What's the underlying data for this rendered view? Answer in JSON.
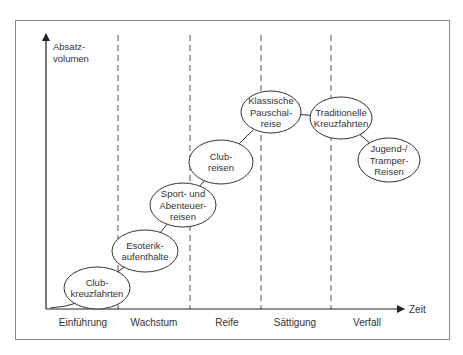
{
  "diagram": {
    "title": "",
    "y_axis_label": [
      "Absatz-",
      "volumen"
    ],
    "x_axis_label": "Zeit",
    "phases": [
      {
        "label": "Einführung"
      },
      {
        "label": "Wachstum"
      },
      {
        "label": "Reife"
      },
      {
        "label": "Sättigung"
      },
      {
        "label": "Verfall"
      }
    ],
    "nodes": [
      {
        "id": "clubkreuzfahrten",
        "lines": [
          "Club-",
          "kreuzfahrten"
        ],
        "phase": "Einführung"
      },
      {
        "id": "esoterik",
        "lines": [
          "Esoterik-",
          "aufenthalte"
        ],
        "phase": "Wachstum"
      },
      {
        "id": "sport",
        "lines": [
          "Sport- und",
          "Abenteuer-",
          "reisen"
        ],
        "phase": "Wachstum"
      },
      {
        "id": "clubreisen",
        "lines": [
          "Club-",
          "reisen"
        ],
        "phase": "Reife"
      },
      {
        "id": "pauschalreise",
        "lines": [
          "Klassische",
          "Pauschal-",
          "reise"
        ],
        "phase": "Reife/Sättigung"
      },
      {
        "id": "kreuzfahrten",
        "lines": [
          "Traditionelle",
          "Kreuzfahrten"
        ],
        "phase": "Sättigung/Verfall"
      },
      {
        "id": "jugend",
        "lines": [
          "Jugend-/",
          "Tramper-",
          "Reisen"
        ],
        "phase": "Verfall"
      }
    ],
    "edges": [
      [
        "clubkreuzfahrten",
        "esoterik"
      ],
      [
        "esoterik",
        "sport"
      ],
      [
        "sport",
        "clubreisen"
      ],
      [
        "clubreisen",
        "pauschalreise"
      ],
      [
        "pauschalreise",
        "kreuzfahrten"
      ],
      [
        "kreuzfahrten",
        "jugend"
      ]
    ],
    "colors": {
      "line": "#333333",
      "dash": "#555555",
      "frame": "#888888"
    }
  }
}
